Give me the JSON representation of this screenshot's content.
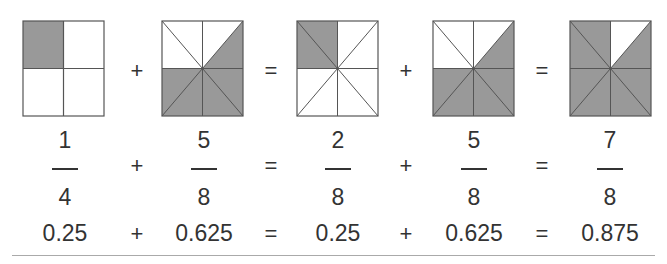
{
  "colors": {
    "fill": "#999999",
    "stroke": "#555555",
    "text": "#333333"
  },
  "squares": [
    {
      "id": "q1",
      "divisions": 4,
      "shaded": [
        0
      ],
      "label": "1/4"
    },
    {
      "id": "q2",
      "divisions": 8,
      "shaded": [
        2,
        4,
        5,
        6,
        7
      ],
      "label": "5/8"
    },
    {
      "id": "q3",
      "divisions": 8,
      "shaded": [
        0,
        1
      ],
      "label": "2/8"
    },
    {
      "id": "q4",
      "divisions": 8,
      "shaded": [
        2,
        4,
        5,
        6,
        7
      ],
      "label": "5/8"
    },
    {
      "id": "q5",
      "divisions": 8,
      "shaded": [
        0,
        1,
        3,
        4,
        5,
        6,
        7
      ],
      "label": "7/8"
    }
  ],
  "operators": [
    "+",
    "=",
    "+",
    "="
  ],
  "fractions": [
    {
      "numerator": "1",
      "denominator": "4",
      "decimal": "0.25"
    },
    {
      "numerator": "5",
      "denominator": "8",
      "decimal": "0.625"
    },
    {
      "numerator": "2",
      "denominator": "8",
      "decimal": "0.25"
    },
    {
      "numerator": "5",
      "denominator": "8",
      "decimal": "0.625"
    },
    {
      "numerator": "7",
      "denominator": "8",
      "decimal": "0.875"
    }
  ]
}
